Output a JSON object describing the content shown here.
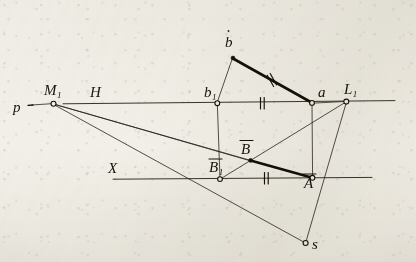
{
  "figure": {
    "kind": "descriptive-geometry-construction",
    "ink_color": "#1a1713",
    "paper_color": "#f2f0ea",
    "reference_lines": [
      {
        "name": "H",
        "label": "H",
        "y": 103,
        "x_start": 63,
        "x_end": 395
      },
      {
        "name": "X",
        "label": "X",
        "y": 178,
        "x_start": 113,
        "x_end": 372
      }
    ],
    "points": [
      {
        "id": "p",
        "label": "p",
        "sub": "",
        "x": 24,
        "y": 105,
        "marker": "tick"
      },
      {
        "id": "M1",
        "label": "M",
        "sub": "1",
        "x": 53,
        "y": 103,
        "marker": "circle"
      },
      {
        "id": "b",
        "label": "b",
        "sub": "",
        "x": 232,
        "y": 57,
        "marker": "dot"
      },
      {
        "id": "b1",
        "label": "b",
        "sub": "1",
        "x": 217,
        "y": 103,
        "marker": "circle"
      },
      {
        "id": "a",
        "label": "a",
        "sub": "",
        "x": 312,
        "y": 103,
        "marker": "circle"
      },
      {
        "id": "L1",
        "label": "L",
        "sub": "1",
        "x": 346,
        "y": 101,
        "marker": "circle"
      },
      {
        "id": "Bbar",
        "label": "B",
        "sub": "",
        "x": 250,
        "y": 160,
        "marker": "dot",
        "overline": true
      },
      {
        "id": "Bbar1",
        "label": "B",
        "sub": "1",
        "x": 220,
        "y": 179,
        "marker": "circle",
        "overline": true
      },
      {
        "id": "Abar",
        "label": "A",
        "sub": "",
        "x": 312,
        "y": 178,
        "marker": "circle",
        "overline": true
      },
      {
        "id": "s",
        "label": "s",
        "sub": "",
        "x": 305,
        "y": 243,
        "marker": "circle"
      }
    ],
    "thin_segments": [
      {
        "name": "p-to-M1",
        "from": "p",
        "to": "M1"
      },
      {
        "name": "b1-to-b",
        "from": "b1",
        "to": "b"
      },
      {
        "name": "b1-vertical",
        "from": "b1",
        "to": "Bbar1"
      },
      {
        "name": "a-vertical",
        "from": "a",
        "to": "Abar"
      },
      {
        "name": "M1-to-Bbar-ray",
        "from": "M1",
        "to": "Abar"
      },
      {
        "name": "M1-to-Abar-ray",
        "from": "M1",
        "to": "Bbar"
      },
      {
        "name": "M1-to-s-ray",
        "from": "M1",
        "to": "s"
      },
      {
        "name": "Bbar1-to-L1",
        "from": "Bbar1",
        "to": "L1"
      },
      {
        "name": "L1-to-s",
        "from": "L1",
        "to": "s"
      },
      {
        "name": "a-to-L1",
        "from": "a",
        "to": "L1"
      }
    ],
    "heavy_segments": [
      {
        "name": "b-to-a",
        "from": "b",
        "to": "a",
        "ticks": 2
      },
      {
        "name": "Bbar-to-Abar",
        "from": "Bbar",
        "to": "Abar",
        "ticks": 0
      }
    ],
    "tick_marks": [
      {
        "name": "tick-b-a",
        "on": "b-to-a",
        "count": 2,
        "x": 272,
        "y": 80,
        "angle": -27
      },
      {
        "name": "tick-b1-a",
        "on": "H-line",
        "count": 2,
        "x": 262,
        "y": 103,
        "angle": 0
      },
      {
        "name": "tick-Bbar1-Abar",
        "on": "X-line",
        "count": 2,
        "x": 266,
        "y": 178,
        "angle": 0
      }
    ]
  },
  "labels": {
    "H": "H",
    "X": "X",
    "p": "p",
    "M": "M",
    "M_sub": "1",
    "b": "b",
    "b1_sub": "1",
    "a": "a",
    "L": "L",
    "L_sub": "1",
    "B_bar": "B",
    "B1_bar_sub": "1",
    "A_bar": "A",
    "s": "s"
  }
}
